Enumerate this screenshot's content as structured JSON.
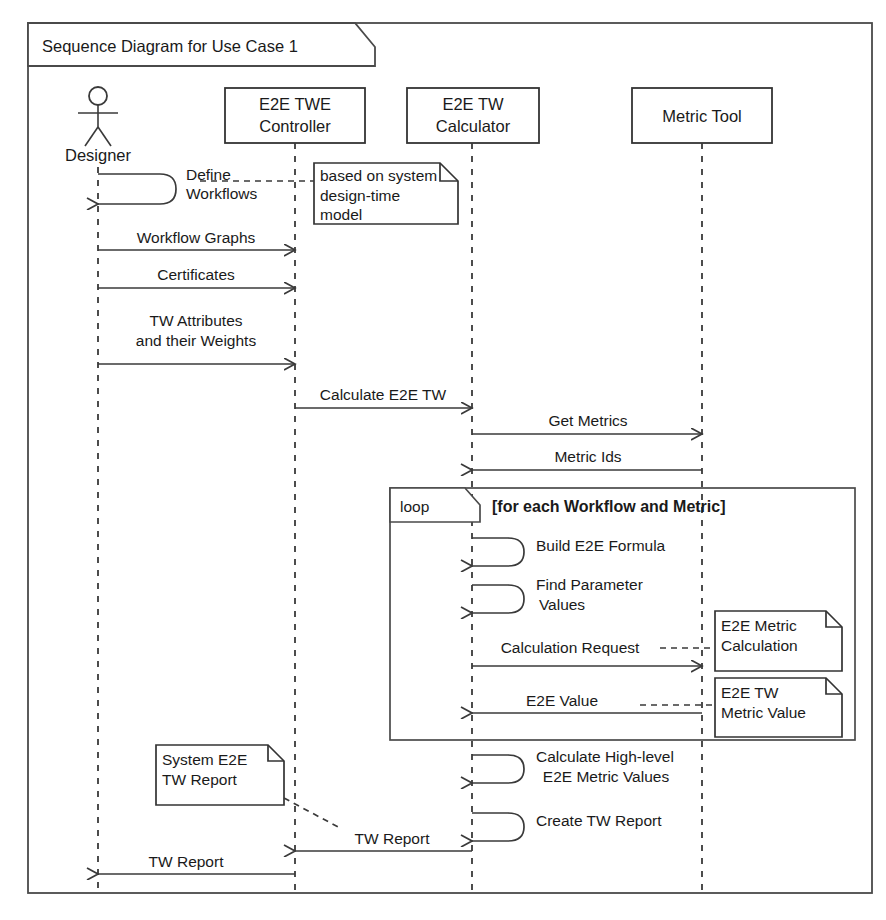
{
  "diagram": {
    "kind": "uml-sequence-diagram",
    "frame_label": "Sequence Diagram for Use Case 1",
    "lifelines": [
      {
        "id": "designer",
        "label": "Designer",
        "type": "actor",
        "x": 98
      },
      {
        "id": "controller",
        "label_line1": "E2E TWE",
        "label_line2": "Controller",
        "type": "object",
        "x": 295
      },
      {
        "id": "calculator",
        "label_line1": "E2E TW",
        "label_line2": "Calculator",
        "type": "object",
        "x": 472
      },
      {
        "id": "metrictool",
        "label_line1": "Metric Tool",
        "label_line2": "",
        "type": "object",
        "x": 702
      }
    ],
    "messages": [
      {
        "id": "m1",
        "label_line1": "Define",
        "label_line2": "Workflows",
        "kind": "self",
        "from": "designer",
        "to": "designer"
      },
      {
        "id": "m2",
        "label_line1": "Workflow Graphs",
        "label_line2": "",
        "kind": "sync",
        "from": "designer",
        "to": "controller"
      },
      {
        "id": "m3",
        "label_line1": "Certificates",
        "label_line2": "",
        "kind": "sync",
        "from": "designer",
        "to": "controller"
      },
      {
        "id": "m4",
        "label_line1": "TW Attributes",
        "label_line2": "and their Weights",
        "kind": "sync",
        "from": "designer",
        "to": "controller"
      },
      {
        "id": "m5",
        "label_line1": "Calculate E2E TW",
        "label_line2": "",
        "kind": "sync",
        "from": "controller",
        "to": "calculator"
      },
      {
        "id": "m6",
        "label_line1": "Get Metrics",
        "label_line2": "",
        "kind": "sync",
        "from": "calculator",
        "to": "metrictool"
      },
      {
        "id": "m7",
        "label_line1": "Metric Ids",
        "label_line2": "",
        "kind": "return",
        "from": "metrictool",
        "to": "calculator"
      },
      {
        "id": "m8",
        "label_line1": "Build E2E Formula",
        "label_line2": "",
        "kind": "self",
        "from": "calculator",
        "to": "calculator"
      },
      {
        "id": "m9",
        "label_line1": "Find Parameter",
        "label_line2": "Values",
        "kind": "self",
        "from": "calculator",
        "to": "calculator"
      },
      {
        "id": "m10",
        "label_line1": "Calculation Request",
        "label_line2": "",
        "kind": "sync",
        "from": "calculator",
        "to": "metrictool"
      },
      {
        "id": "m11",
        "label_line1": "E2E Value",
        "label_line2": "",
        "kind": "return",
        "from": "metrictool",
        "to": "calculator"
      },
      {
        "id": "m12",
        "label_line1": "Calculate High-level",
        "label_line2": "E2E Metric Values",
        "kind": "self",
        "from": "calculator",
        "to": "calculator"
      },
      {
        "id": "m13",
        "label_line1": "Create TW Report",
        "label_line2": "",
        "kind": "self",
        "from": "calculator",
        "to": "calculator"
      },
      {
        "id": "m14",
        "label_line1": "TW Report",
        "label_line2": "",
        "kind": "return",
        "from": "calculator",
        "to": "controller"
      },
      {
        "id": "m15",
        "label_line1": "TW Report",
        "label_line2": "",
        "kind": "return",
        "from": "controller",
        "to": "designer"
      }
    ],
    "fragment": {
      "id": "loop-fragment",
      "operator": "loop",
      "guard": "[for each Workflow and Metric]"
    },
    "notes": [
      {
        "id": "note-design-time",
        "lines": [
          "based on system",
          "design-time",
          "model"
        ],
        "anchor": "m1"
      },
      {
        "id": "note-e2e-metric-calculation",
        "lines": [
          "E2E Metric",
          "Calculation"
        ],
        "anchor": "m10"
      },
      {
        "id": "note-e2e-tw-metric-value",
        "lines": [
          "E2E TW",
          "Metric Value"
        ],
        "anchor": "m11"
      },
      {
        "id": "note-system-e2e-tw-report",
        "lines": [
          "System E2E",
          "TW Report"
        ],
        "anchor": "m14"
      }
    ],
    "colors": {
      "line": "#3a3a3a",
      "text": "#1a1a1a",
      "background": "#ffffff"
    }
  }
}
